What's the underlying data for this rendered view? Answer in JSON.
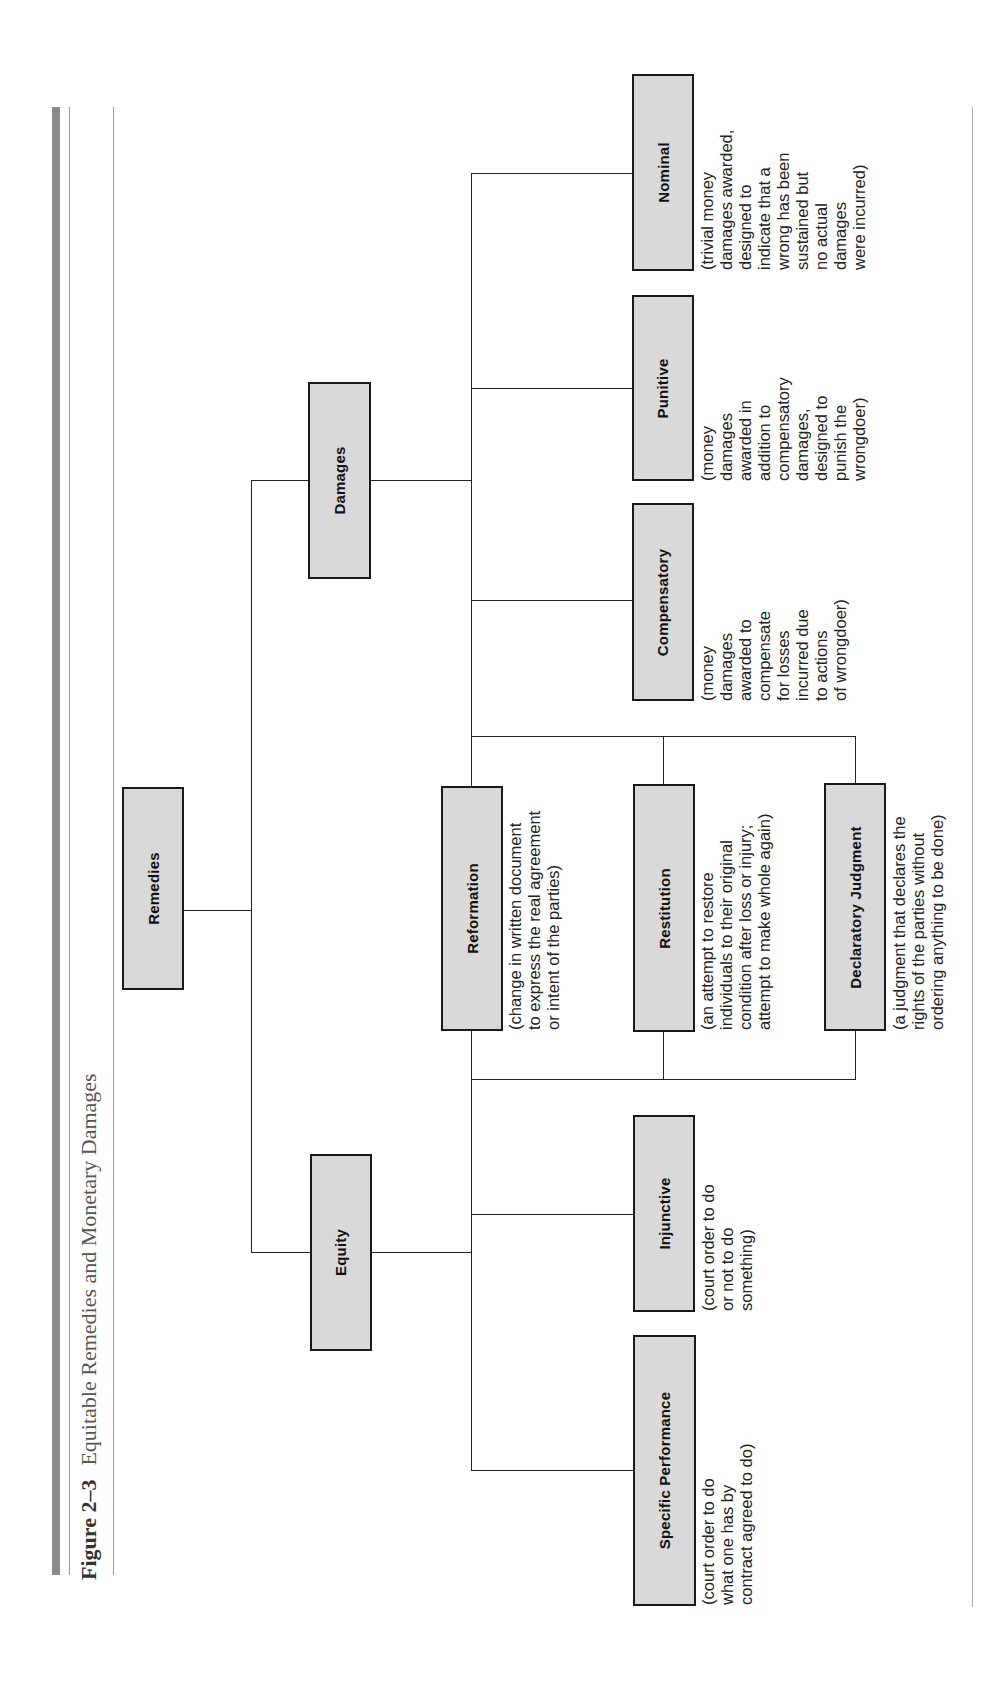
{
  "figure": {
    "number": "Figure 2–3",
    "title": "Equitable Remedies and Monetary Damages"
  },
  "nodes": {
    "remedies": {
      "label": "Remedies"
    },
    "equity": {
      "label": "Equity"
    },
    "damages": {
      "label": "Damages"
    },
    "specific_performance": {
      "label": "Specific Performance",
      "description": "(court order to do\nwhat one has by\ncontract agreed to do)"
    },
    "injunctive": {
      "label": "Injunctive",
      "description": "(court order to do\nor not to do\nsomething)"
    },
    "reformation": {
      "label": "Reformation",
      "description": "(change in written document\nto express the real agreement\nor intent of the parties)"
    },
    "restitution": {
      "label": "Restitution",
      "description": "(an attempt to restore\nindividuals to their original\ncondition after loss or injury;\nattempt to make whole again)"
    },
    "declaratory_judgment": {
      "label": "Declaratory Judgment",
      "description": "(a judgment that declares the\nrights of the parties without\nordering anything to be done)"
    },
    "compensatory": {
      "label": "Compensatory",
      "description": "(money\ndamages\nawarded to\ncompensate\nfor losses\nincurred due\nto actions\nof wrongdoer)"
    },
    "punitive": {
      "label": "Punitive",
      "description": "(money\ndamages\nawarded in\naddition to\ncompensatory\ndamages,\ndesigned to\npunish the\nwrongdoer)"
    },
    "nominal": {
      "label": "Nominal",
      "description": "(trivial money\ndamages awarded,\ndesigned to\nindicate that a\nwrong has been\nsustained but\nno actual\ndamages\nwere incurred)"
    }
  },
  "colors": {
    "box_fill": "#d9d9d9",
    "box_border": "#1a1a1a",
    "accent_bar": "#8a8a8a"
  }
}
